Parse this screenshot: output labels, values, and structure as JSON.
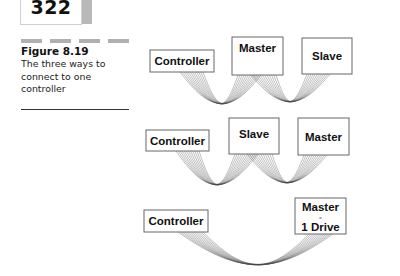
{
  "page": {
    "number": "322"
  },
  "figure": {
    "title": "Figure 8.19",
    "caption_lines": [
      "The three ways to",
      "connect to one",
      "controller"
    ]
  },
  "diagram": {
    "rows": [
      {
        "devices": [
          {
            "label": "Controller",
            "x": 150,
            "y": 50,
            "w": 64,
            "h": 22
          },
          {
            "label": "Master",
            "x": 232,
            "y": 37,
            "w": 51,
            "h": 38
          },
          {
            "label": "Slave",
            "x": 302,
            "y": 38,
            "w": 50,
            "h": 36
          }
        ]
      },
      {
        "devices": [
          {
            "label": "Controller",
            "x": 146,
            "y": 130,
            "w": 63,
            "h": 21
          },
          {
            "label": "Slave",
            "x": 229,
            "y": 118,
            "w": 50,
            "h": 36
          },
          {
            "label": "Master",
            "x": 298,
            "y": 118,
            "w": 51,
            "h": 37
          }
        ]
      },
      {
        "devices": [
          {
            "label": "Controller",
            "x": 144,
            "y": 210,
            "w": 64,
            "h": 22
          },
          {
            "label": "Master",
            "sub": "or",
            "label2": "1 Drive",
            "x": 295,
            "y": 198,
            "w": 51,
            "h": 36
          }
        ]
      }
    ]
  }
}
